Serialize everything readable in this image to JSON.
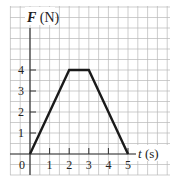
{
  "chart_data": {
    "type": "line",
    "title": "",
    "xlabel": "t (s)",
    "ylabel": "F (N)",
    "x": [
      0,
      2,
      3,
      5
    ],
    "series": [
      {
        "name": "F",
        "values": [
          0,
          4,
          4,
          0
        ]
      }
    ],
    "xticks": [
      "0",
      "1",
      "2",
      "3",
      "4",
      "5"
    ],
    "yticks": [
      "1",
      "2",
      "3",
      "4"
    ],
    "xlim": [
      0,
      5
    ],
    "ylim": [
      0,
      4
    ],
    "grid": true,
    "legend": "none"
  },
  "labels": {
    "y_axis": "F (N)",
    "x_axis": "t (s)",
    "origin": "0"
  },
  "colors": {
    "grid": "#b8b8b8",
    "axis": "#333333",
    "line": "#1a1a1a"
  }
}
